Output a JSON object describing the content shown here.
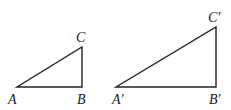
{
  "figure": {
    "stroke_color": "#222222",
    "triangles": [
      {
        "id": "ABC",
        "vertices": {
          "A": {
            "x": 17,
            "y": 87
          },
          "B": {
            "x": 82,
            "y": 87
          },
          "C": {
            "x": 82,
            "y": 47
          }
        },
        "labels": {
          "A": {
            "text": "A",
            "x": 8,
            "y": 104
          },
          "B": {
            "text": "B",
            "x": 77,
            "y": 104
          },
          "C": {
            "text": "C",
            "x": 76,
            "y": 42
          }
        }
      },
      {
        "id": "A'B'C'",
        "vertices": {
          "A": {
            "x": 116,
            "y": 87
          },
          "B": {
            "x": 216,
            "y": 87
          },
          "C": {
            "x": 216,
            "y": 27
          }
        },
        "labels": {
          "A": {
            "text": "A′",
            "x": 112,
            "y": 104
          },
          "B": {
            "text": "B′",
            "x": 209,
            "y": 104
          },
          "C": {
            "text": "C′",
            "x": 208,
            "y": 22
          }
        }
      }
    ]
  }
}
